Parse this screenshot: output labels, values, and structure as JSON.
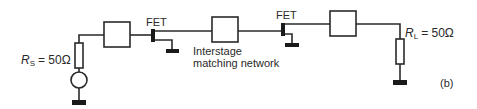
{
  "diagram": {
    "type": "two-stage FET amplifier schematic",
    "panel_label": "(b)",
    "components": {
      "source_resistor": {
        "symbol": "R",
        "subscript": "S",
        "value": "= 50Ω"
      },
      "load_resistor": {
        "symbol": "R",
        "subscript": "L",
        "value": "= 50Ω"
      },
      "fet1": {
        "label": "FET"
      },
      "fet2": {
        "label": "FET"
      },
      "interstage": {
        "line1": "Interstage",
        "line2": "matching network"
      }
    },
    "blocks": [
      "input matching network",
      "interstage matching network",
      "output matching network"
    ],
    "colors": {
      "ink": "#2a2a2a",
      "background": "#ffffff"
    }
  }
}
